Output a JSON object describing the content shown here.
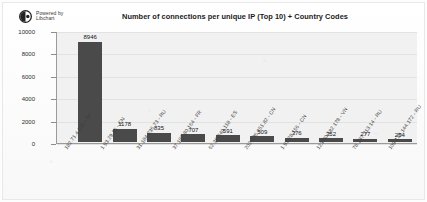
{
  "logo": {
    "mark": "libchart-logo-icon",
    "line1": "Powered by",
    "line2": "Libchart"
  },
  "chart_data": {
    "type": "bar",
    "title": "Number of connections per unique IP (Top 10) + Country Codes",
    "xlabel": "",
    "ylabel": "",
    "ylim": [
      0,
      10000
    ],
    "yticks": [
      "0",
      "2000",
      "4000",
      "6000",
      "8000",
      "10000"
    ],
    "grid": true,
    "legend": null,
    "bar_color": "#4a4a4a",
    "plot_background": "#f1f1f1",
    "categories": [
      "182.71.4.231 - IN",
      "1.93.29.16 - CN",
      "31.184.236.73 - RU",
      "37.187.80.164 - FR",
      "62.36.240.118 - ES",
      "202.106.251.82 - CN",
      "1.93.28.156 - CN",
      "123.30.182.178 - VN",
      "78.137.213.14 - RU",
      "109.120.144.172 - RU"
    ],
    "values": [
      8946,
      1178,
      835,
      707,
      591,
      509,
      376,
      352,
      277,
      254
    ],
    "value_labels": [
      "8946",
      "1178",
      "835",
      "707",
      "591",
      "509",
      "376",
      "352",
      "277",
      "254"
    ]
  }
}
